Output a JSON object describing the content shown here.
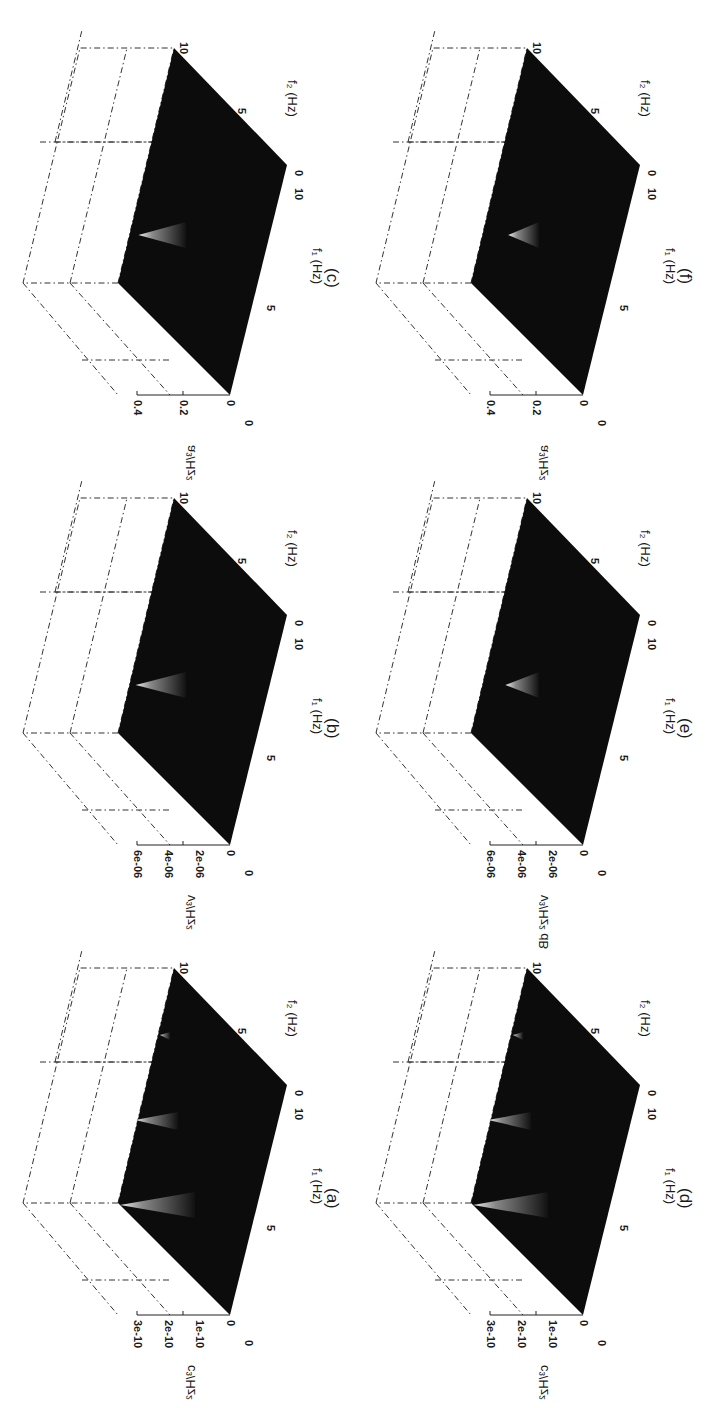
{
  "figure": {
    "layout": "3 rows x 2 columns, figure rotated 90 degrees on page",
    "panels": [
      {
        "id": "c",
        "caption": "(c)",
        "zlabel": "a³/Hz²",
        "zticks": [
          "0",
          "0.2",
          "0.4"
        ],
        "peak": "single",
        "peak_intensity": 0.85
      },
      {
        "id": "f",
        "caption": "(f)",
        "zlabel": "a³/Hz²",
        "zticks": [
          "0",
          "0.2",
          "0.4"
        ],
        "peak": "single",
        "peak_intensity": 0.55
      },
      {
        "id": "b",
        "caption": "(b)",
        "zlabel": "v³/Hz²",
        "zticks": [
          "0",
          "2e-06",
          "4e-06",
          "6e-06"
        ],
        "peak": "single",
        "peak_intensity": 0.9
      },
      {
        "id": "e",
        "caption": "(e)",
        "zlabel": "v³/Hz² dB",
        "zticks": [
          "0",
          "2e-06",
          "4e-06",
          "6e-06"
        ],
        "peak": "single",
        "peak_intensity": 0.6
      },
      {
        "id": "a",
        "caption": "(a)",
        "zlabel": "c³/Hz²",
        "zticks": [
          "0",
          "1e-10",
          "2e-10",
          "3e-10"
        ],
        "peak": "multiple",
        "peak_intensity": 0.9
      },
      {
        "id": "d",
        "caption": "(d)",
        "zlabel": "c³/Hz²",
        "zticks": [
          "0",
          "1e-10",
          "2e-10",
          "3e-10"
        ],
        "peak": "multiple",
        "peak_intensity": 0.75
      }
    ],
    "f1_label": "f₁ (Hz)",
    "f2_label": "f₂ (Hz)",
    "f1_ticks": [
      "0",
      "5",
      "10"
    ],
    "f2_ticks": [
      "0",
      "5",
      "10"
    ]
  },
  "chart_data": [
    {
      "type": "surface3d",
      "title": "(a)",
      "xlabel": "f1 (Hz)",
      "ylabel": "f2 (Hz)",
      "zlabel": "c^3/Hz^2",
      "xlim": [
        0,
        10
      ],
      "ylim": [
        0,
        10
      ],
      "zlim": [
        0,
        3e-10
      ],
      "zticks": [
        0,
        1e-10,
        2e-10,
        3e-10
      ],
      "peaks": [
        {
          "f1": 5,
          "f2": 5,
          "z": 3e-10
        },
        {
          "f1": 3,
          "f2": 0,
          "z": 2e-10
        },
        {
          "f1": 5,
          "f2": 0,
          "z": 1e-10
        },
        {
          "f1": 5,
          "f2": 7,
          "z": 2e-11
        }
      ]
    },
    {
      "type": "surface3d",
      "title": "(b)",
      "xlabel": "f1 (Hz)",
      "ylabel": "f2 (Hz)",
      "zlabel": "v^3/Hz^2",
      "xlim": [
        0,
        10
      ],
      "ylim": [
        0,
        10
      ],
      "zlim": [
        0,
        6e-06
      ],
      "zticks": [
        0,
        2e-06,
        4e-06,
        6e-06
      ],
      "peaks": [
        {
          "f1": 7,
          "f2": 5,
          "z": 6e-06
        }
      ]
    },
    {
      "type": "surface3d",
      "title": "(c)",
      "xlabel": "f1 (Hz)",
      "ylabel": "f2 (Hz)",
      "zlabel": "a^3/Hz^2",
      "xlim": [
        0,
        10
      ],
      "ylim": [
        0,
        10
      ],
      "zlim": [
        0,
        0.4
      ],
      "zticks": [
        0,
        0.2,
        0.4
      ],
      "peaks": [
        {
          "f1": 7,
          "f2": 5,
          "z": 0.4
        }
      ]
    },
    {
      "type": "surface3d",
      "title": "(d)",
      "xlabel": "f1 (Hz)",
      "ylabel": "f2 (Hz)",
      "zlabel": "c^3/Hz^2",
      "xlim": [
        0,
        10
      ],
      "ylim": [
        0,
        10
      ],
      "zlim": [
        0,
        3e-10
      ],
      "zticks": [
        0,
        1e-10,
        2e-10,
        3e-10
      ],
      "peaks": [
        {
          "f1": 5,
          "f2": 5,
          "z": 2.5e-10
        },
        {
          "f1": 3,
          "f2": 0,
          "z": 2e-10
        },
        {
          "f1": 5,
          "f2": 0,
          "z": 1e-10
        }
      ]
    },
    {
      "type": "surface3d",
      "title": "(e)",
      "xlabel": "f1 (Hz)",
      "ylabel": "f2 (Hz)",
      "zlabel": "v^3/Hz^2 dB",
      "xlim": [
        0,
        10
      ],
      "ylim": [
        0,
        10
      ],
      "zlim": [
        0,
        6e-06
      ],
      "zticks": [
        0,
        2e-06,
        4e-06,
        6e-06
      ],
      "peaks": [
        {
          "f1": 7,
          "f2": 5,
          "z": 4.5e-06
        }
      ]
    },
    {
      "type": "surface3d",
      "title": "(f)",
      "xlabel": "f1 (Hz)",
      "ylabel": "f2 (Hz)",
      "zlabel": "a^3/Hz^2",
      "xlim": [
        0,
        10
      ],
      "ylim": [
        0,
        10
      ],
      "zlim": [
        0,
        0.4
      ],
      "zticks": [
        0,
        0.2,
        0.4
      ],
      "peaks": [
        {
          "f1": 7,
          "f2": 5,
          "z": 0.3
        }
      ]
    }
  ]
}
